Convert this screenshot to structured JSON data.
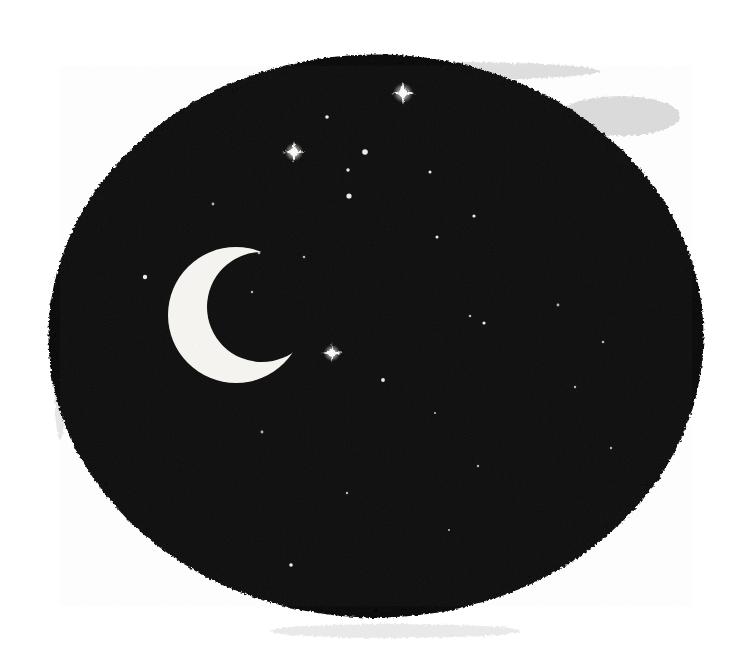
{
  "artwork": {
    "title": "Crescent Moon and Stars in a Night Sky",
    "medium": "woodcut / linocut relief print",
    "alt_text": "A roughly circular field of solid black ink with a white crescent moon at left of center and many small white stars scattered across it.",
    "canvas": {
      "width": 748,
      "height": 666,
      "background_color": "#ffffff"
    },
    "palette": {
      "ink_black": "#0d0d0d",
      "deep_black": "#060606",
      "paper_white": "#ffffff",
      "star_white": "#f8f8f6",
      "moon_white": "#f4f3ef",
      "ghost_gray": "#b9b9b9",
      "smudge_gray": "#d8d8d8"
    },
    "night_field": {
      "name": "inked-night-disc",
      "shape": "irregular rounded oblong",
      "center_x": 376,
      "center_y": 336,
      "radius_x": 326,
      "radius_y": 280,
      "fill": "#0d0d0d",
      "edge_quality": "ragged, hand-cut, speckled"
    },
    "moon": {
      "name": "crescent-moon",
      "phase": "waxing crescent",
      "opening_direction": "right",
      "center_x": 236,
      "center_y": 315,
      "outer_radius": 68,
      "inner_radius": 55,
      "inner_offset_x": 26,
      "inner_offset_y": -8,
      "fill": "#f4f3ef"
    },
    "ghost_marks": [
      {
        "name": "top-ink-wisp",
        "x": 300,
        "y": 62,
        "width": 300,
        "height": 18,
        "opacity": 0.45
      },
      {
        "name": "top-right-ink-trail",
        "x": 560,
        "y": 96,
        "width": 120,
        "height": 40,
        "opacity": 0.5
      },
      {
        "name": "bottom-smudge",
        "x": 270,
        "y": 624,
        "width": 250,
        "height": 14,
        "opacity": 0.3
      },
      {
        "name": "left-edge-fleck",
        "x": 54,
        "y": 300,
        "width": 12,
        "height": 140,
        "opacity": 0.35
      }
    ],
    "stars": [
      {
        "name": "star-burst-top",
        "x": 403,
        "y": 93,
        "r": 5.0,
        "burst": true,
        "rays": 7.0
      },
      {
        "name": "star-small-upper-a",
        "x": 327,
        "y": 117,
        "r": 1.8,
        "burst": false,
        "rays": 0
      },
      {
        "name": "star-burst-upper-left",
        "x": 294,
        "y": 152,
        "r": 4.6,
        "burst": true,
        "rays": 6.5
      },
      {
        "name": "star-medium-upper-b",
        "x": 365,
        "y": 152,
        "r": 2.8,
        "burst": false,
        "rays": 0
      },
      {
        "name": "star-small-upper-c",
        "x": 348,
        "y": 170,
        "r": 1.7,
        "burst": false,
        "rays": 0
      },
      {
        "name": "star-medium-upper-d",
        "x": 349,
        "y": 196,
        "r": 2.6,
        "burst": false,
        "rays": 0
      },
      {
        "name": "star-tiny-upper-e",
        "x": 430,
        "y": 172,
        "r": 1.5,
        "burst": false,
        "rays": 0
      },
      {
        "name": "star-tiny-upper-f",
        "x": 474,
        "y": 216,
        "r": 1.6,
        "burst": false,
        "rays": 0
      },
      {
        "name": "star-tiny-upper-g",
        "x": 437,
        "y": 237,
        "r": 1.5,
        "burst": false,
        "rays": 0
      },
      {
        "name": "star-tiny-left-h",
        "x": 213,
        "y": 204,
        "r": 1.4,
        "burst": false,
        "rays": 0
      },
      {
        "name": "star-tiny-mid-i",
        "x": 259,
        "y": 253,
        "r": 1.3,
        "burst": false,
        "rays": 0
      },
      {
        "name": "star-tiny-mid-j",
        "x": 304,
        "y": 257,
        "r": 1.3,
        "burst": false,
        "rays": 0
      },
      {
        "name": "star-small-left-k",
        "x": 145,
        "y": 277,
        "r": 2.2,
        "burst": false,
        "rays": 0
      },
      {
        "name": "star-tiny-mid-l",
        "x": 252,
        "y": 292,
        "r": 1.2,
        "burst": false,
        "rays": 0
      },
      {
        "name": "star-tiny-right-m",
        "x": 484,
        "y": 323,
        "r": 1.6,
        "burst": false,
        "rays": 0
      },
      {
        "name": "star-burst-lower-mid",
        "x": 332,
        "y": 353,
        "r": 4.2,
        "burst": true,
        "rays": 5.8
      },
      {
        "name": "star-tiny-lower-n",
        "x": 470,
        "y": 316,
        "r": 1.3,
        "burst": false,
        "rays": 0
      },
      {
        "name": "star-tiny-lower-o",
        "x": 383,
        "y": 380,
        "r": 1.9,
        "burst": false,
        "rays": 0
      },
      {
        "name": "star-tiny-lower-p",
        "x": 558,
        "y": 305,
        "r": 1.4,
        "burst": false,
        "rays": 0
      },
      {
        "name": "star-tiny-lower-q",
        "x": 603,
        "y": 342,
        "r": 1.3,
        "burst": false,
        "rays": 0
      },
      {
        "name": "star-tiny-lower-r",
        "x": 575,
        "y": 387,
        "r": 1.2,
        "burst": false,
        "rays": 0
      },
      {
        "name": "star-tiny-lower-s",
        "x": 478,
        "y": 466,
        "r": 1.2,
        "burst": false,
        "rays": 0
      },
      {
        "name": "star-tiny-lower-t",
        "x": 262,
        "y": 432,
        "r": 1.4,
        "burst": false,
        "rays": 0
      },
      {
        "name": "star-tiny-lower-u",
        "x": 347,
        "y": 493,
        "r": 1.2,
        "burst": false,
        "rays": 0
      },
      {
        "name": "star-tiny-lower-v",
        "x": 291,
        "y": 565,
        "r": 1.8,
        "burst": false,
        "rays": 0
      },
      {
        "name": "star-tiny-lower-w",
        "x": 449,
        "y": 530,
        "r": 1.1,
        "burst": false,
        "rays": 0
      },
      {
        "name": "star-tiny-lower-x",
        "x": 611,
        "y": 448,
        "r": 1.2,
        "burst": false,
        "rays": 0
      },
      {
        "name": "star-tiny-lower-y",
        "x": 196,
        "y": 345,
        "r": 1.2,
        "burst": false,
        "rays": 0
      },
      {
        "name": "star-tiny-lower-z",
        "x": 435,
        "y": 413,
        "r": 1.1,
        "burst": false,
        "rays": 0
      }
    ]
  }
}
